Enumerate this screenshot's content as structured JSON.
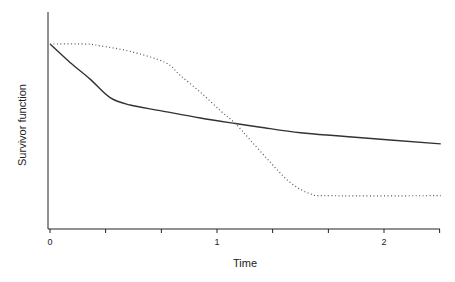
{
  "chart_data": {
    "type": "line",
    "title": "",
    "xlabel": "Time",
    "ylabel": "Survivor function",
    "xlim": [
      0,
      2.34
    ],
    "ylim": [
      0,
      1.0
    ],
    "x_ticks": [
      0,
      0.333,
      0.667,
      1,
      1.333,
      1.667,
      2,
      2.333
    ],
    "x_tick_labels": [
      "0",
      "",
      "",
      "1",
      "",
      "",
      "2",
      ""
    ],
    "y_ticks": [],
    "y_tick_labels": [],
    "grid": false,
    "legend": null,
    "series": [
      {
        "name": "solid",
        "style": "solid",
        "color": "#333333",
        "x": [
          0,
          0.12,
          0.24,
          0.36,
          0.48,
          0.66,
          0.9,
          1.11,
          1.26,
          1.5,
          1.77,
          2.34
        ],
        "y": [
          1.0,
          0.9,
          0.81,
          0.71,
          0.67,
          0.64,
          0.6,
          0.57,
          0.55,
          0.52,
          0.5,
          0.46
        ]
      },
      {
        "name": "dotted",
        "style": "dotted",
        "color": "#555555",
        "x": [
          0,
          0.21,
          0.3,
          0.48,
          0.69,
          0.78,
          0.9,
          1.02,
          1.11,
          1.2,
          1.32,
          1.44,
          1.56,
          1.68,
          2.34
        ],
        "y": [
          1.0,
          1.0,
          0.99,
          0.96,
          0.9,
          0.83,
          0.74,
          0.64,
          0.57,
          0.48,
          0.36,
          0.25,
          0.19,
          0.18,
          0.18
        ]
      }
    ]
  }
}
